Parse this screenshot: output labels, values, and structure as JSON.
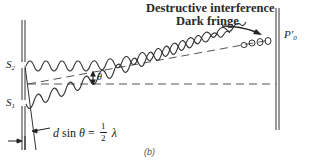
{
  "diagram": {
    "labels": {
      "title_line1": "Destructive interference",
      "title_line2": "Dark fringe",
      "screen_point": "P′",
      "screen_point_sub": "0",
      "slit_top": "S",
      "slit_top_sub": "2",
      "slit_bottom": "S",
      "slit_bottom_sub": "1",
      "angle": "θ",
      "formula_left_d": "d",
      "formula_sin": " sin ",
      "formula_theta": "θ",
      "formula_eq": " = ",
      "formula_num": "1",
      "formula_den": "2",
      "formula_lambda": "λ",
      "caption": "(b)"
    },
    "elements": [
      "double-slit barrier",
      "wave from S2",
      "wave from S1",
      "center dashed line at angle theta",
      "horizontal dashed axis",
      "viewing screen",
      "dark fringe arrow",
      "path difference markers"
    ],
    "colors": {
      "stroke": "#333333",
      "dashed": "#555555",
      "background": "#ffffff"
    }
  }
}
